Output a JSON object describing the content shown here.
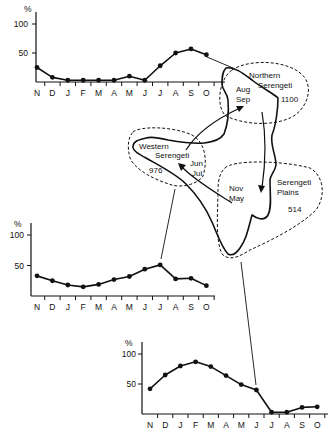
{
  "months": [
    "N",
    "D",
    "J",
    "F",
    "M",
    "A",
    "M",
    "J",
    "J",
    "A",
    "S",
    "O"
  ],
  "y_unit": "%",
  "y_ticks": [
    "100",
    "50"
  ],
  "map": {
    "regions": [
      {
        "name_line1": "Northern",
        "name_line2": "Serengeti",
        "value": "1100",
        "season_line1": "Aug",
        "season_line2": "Sep"
      },
      {
        "name_line1": "Western",
        "name_line2": "Serengeti",
        "value": "976",
        "season_line1": "Jun",
        "season_line2": "Jul"
      },
      {
        "name_line1": "Serengeti",
        "name_line2": "Plains",
        "value": "514",
        "season_line1": "Nov",
        "season_line2": "May"
      }
    ]
  },
  "chart_data": [
    {
      "type": "line",
      "title": "Northern Serengeti",
      "categories": [
        "N",
        "D",
        "J",
        "F",
        "M",
        "A",
        "M",
        "J",
        "J",
        "A",
        "S",
        "O"
      ],
      "values": [
        25,
        8,
        3,
        3,
        3,
        3,
        10,
        3,
        28,
        50,
        57,
        47
      ],
      "xlabel": "",
      "ylabel": "%",
      "ylim": [
        0,
        100
      ],
      "yticks": [
        50,
        100
      ],
      "grid": false
    },
    {
      "type": "line",
      "title": "Western Serengeti",
      "categories": [
        "N",
        "D",
        "J",
        "F",
        "M",
        "A",
        "M",
        "J",
        "J",
        "A",
        "S",
        "O"
      ],
      "values": [
        33,
        25,
        18,
        15,
        19,
        27,
        32,
        44,
        51,
        28,
        29,
        17
      ],
      "xlabel": "",
      "ylabel": "%",
      "ylim": [
        0,
        100
      ],
      "yticks": [
        50,
        100
      ],
      "grid": false
    },
    {
      "type": "line",
      "title": "Serengeti Plains",
      "categories": [
        "N",
        "D",
        "J",
        "F",
        "M",
        "A",
        "M",
        "J",
        "J",
        "A",
        "S",
        "O"
      ],
      "values": [
        42,
        65,
        80,
        87,
        79,
        64,
        49,
        40,
        3,
        3,
        11,
        12
      ],
      "xlabel": "",
      "ylabel": "%",
      "ylim": [
        0,
        100
      ],
      "yticks": [
        50,
        100
      ],
      "grid": false
    }
  ]
}
